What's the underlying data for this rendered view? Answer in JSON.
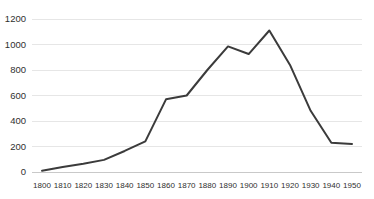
{
  "chart_data": {
    "type": "line",
    "title": "",
    "subtitle": "",
    "xlabel": "",
    "ylabel": "",
    "x": [
      1800,
      1810,
      1820,
      1830,
      1840,
      1850,
      1860,
      1870,
      1880,
      1890,
      1900,
      1910,
      1920,
      1930,
      1940,
      1950
    ],
    "xtick_labels": [
      "1800",
      "1810",
      "1820",
      "1830",
      "1840",
      "1850",
      "1860",
      "1870",
      "1880",
      "1890",
      "1900",
      "1910",
      "1920",
      "1930",
      "1940",
      "1950"
    ],
    "values": [
      10,
      40,
      65,
      95,
      165,
      240,
      570,
      600,
      800,
      985,
      925,
      1110,
      840,
      480,
      230,
      220
    ],
    "series": [
      {
        "name": "series-1",
        "values": [
          10,
          40,
          65,
          95,
          165,
          240,
          570,
          600,
          800,
          985,
          925,
          1110,
          840,
          480,
          230,
          220
        ]
      }
    ],
    "ytick_values": [
      0,
      200,
      400,
      600,
      800,
      1000,
      1200
    ],
    "ytick_labels": [
      "0",
      "200",
      "400",
      "600",
      "800",
      "1000",
      "1200"
    ],
    "xlim": [
      1800,
      1950
    ],
    "ylim": [
      0,
      1200
    ],
    "grid": "horizontal",
    "legend": "none",
    "annotations": [],
    "colors": {
      "line": "#3b3b3b",
      "grid": "#e6e6e6",
      "background": "#ffffff",
      "tick_text": "#2f2f2f"
    }
  },
  "layout": {
    "plot_left": 32,
    "plot_right": 362,
    "plot_top": 19,
    "plot_bottom": 172,
    "x_first_tick": 42,
    "x_last_tick": 352
  }
}
